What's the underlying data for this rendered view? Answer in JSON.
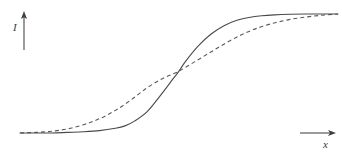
{
  "figure": {
    "background_color": "#ffffff",
    "ink_color": "#4a4a4a",
    "axes": {
      "y_axis": {
        "label": "I",
        "icon": "arrow-up-icon",
        "x": 24,
        "y_top": 12,
        "y_bottom": 50
      },
      "x_axis": {
        "label": "x",
        "icon": "arrow-right-icon",
        "y": 133,
        "x_left": 300,
        "x_right": 336
      }
    }
  },
  "chart_data": {
    "type": "line",
    "xlabel": "x",
    "ylabel": "I",
    "grid": false,
    "legend_position": "none",
    "xlim": [
      0,
      1
    ],
    "ylim": [
      0,
      1
    ],
    "axis_ticks": {
      "x": [],
      "y": []
    },
    "annotations": [
      {
        "text": "I",
        "role": "y-axis-label"
      },
      {
        "text": "x",
        "role": "x-axis-label"
      }
    ],
    "series": [
      {
        "name": "solid-sigmoid",
        "style": "solid",
        "color": "#4a4a4a",
        "linewidth": 1.1,
        "description": "steep sigmoid rising later",
        "x": [
          0.0,
          0.05,
          0.1,
          0.15,
          0.2,
          0.25,
          0.3,
          0.33,
          0.36,
          0.4,
          0.44,
          0.48,
          0.5,
          0.52,
          0.56,
          0.6,
          0.64,
          0.68,
          0.72,
          0.76,
          0.8,
          0.85,
          0.9,
          0.95,
          1.0
        ],
        "y": [
          0.0,
          0.0,
          0.0,
          0.005,
          0.01,
          0.02,
          0.04,
          0.06,
          0.1,
          0.18,
          0.31,
          0.45,
          0.52,
          0.6,
          0.73,
          0.83,
          0.9,
          0.945,
          0.97,
          0.985,
          0.993,
          0.998,
          1.0,
          1.0,
          1.0
        ]
      },
      {
        "name": "dashed-sigmoid",
        "style": "dashed",
        "color": "#5a5a5a",
        "linewidth": 1.1,
        "dash_pattern": [
          4,
          3
        ],
        "description": "shallower sigmoid rising earlier",
        "x": [
          0.0,
          0.05,
          0.1,
          0.15,
          0.2,
          0.25,
          0.3,
          0.35,
          0.4,
          0.45,
          0.5,
          0.55,
          0.6,
          0.65,
          0.7,
          0.75,
          0.8,
          0.85,
          0.9,
          0.95,
          1.0
        ],
        "y": [
          0.0,
          0.005,
          0.015,
          0.035,
          0.07,
          0.12,
          0.19,
          0.28,
          0.38,
          0.46,
          0.52,
          0.6,
          0.68,
          0.76,
          0.83,
          0.885,
          0.925,
          0.955,
          0.975,
          0.99,
          1.0
        ]
      }
    ],
    "crossing_point": {
      "x": 0.5,
      "y": 0.52
    }
  }
}
